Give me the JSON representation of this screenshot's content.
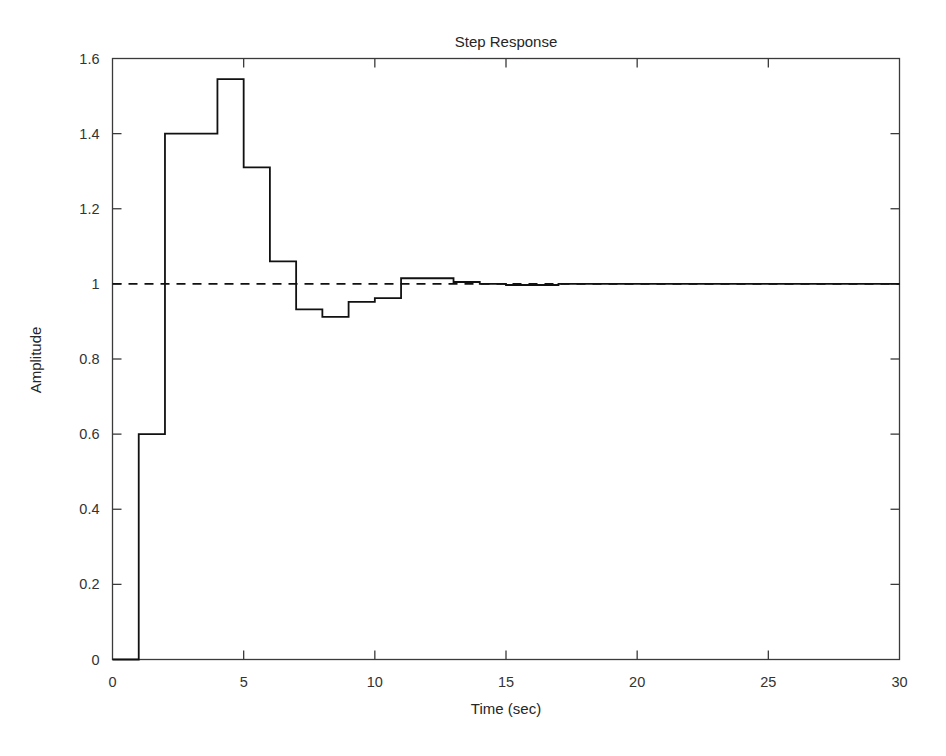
{
  "chart_data": {
    "type": "line",
    "subtype": "step-staircase",
    "title": "Step Response",
    "xlabel": "Time (sec)",
    "ylabel": "Amplitude",
    "xlim": [
      0,
      30
    ],
    "ylim": [
      0,
      1.6
    ],
    "xticks": [
      0,
      5,
      10,
      15,
      20,
      25,
      30
    ],
    "xtick_labels": [
      "0",
      "5",
      "10",
      "15",
      "20",
      "25",
      "30"
    ],
    "yticks": [
      0,
      0.2,
      0.4,
      0.6,
      0.8,
      1,
      1.2,
      1.4,
      1.6
    ],
    "ytick_labels": [
      "0",
      "0.2",
      "0.4",
      "0.6",
      "0.8",
      "1",
      "1.2",
      "1.4",
      "1.6"
    ],
    "grid": false,
    "legend": null,
    "series": [
      {
        "name": "Step Response",
        "style": "staircase",
        "color": "#111111",
        "x": [
          0,
          1,
          2,
          3,
          4,
          5,
          6,
          7,
          8,
          9,
          10,
          11,
          12,
          13,
          14,
          15,
          16,
          17,
          18,
          19,
          20,
          21,
          22,
          23,
          24,
          25,
          26,
          27,
          28,
          29,
          30
        ],
        "values": [
          0,
          0.6,
          1.4,
          1.4,
          1.545,
          1.31,
          1.06,
          0.932,
          0.912,
          0.952,
          0.962,
          1.015,
          1.015,
          1.005,
          1.0,
          0.997,
          0.997,
          1.0,
          1.0,
          1.0,
          1.0,
          1.0,
          1.0,
          1.0,
          1.0,
          1.0,
          1.0,
          1.0,
          1.0,
          1.0,
          1.0
        ]
      },
      {
        "name": "Steady-state reference",
        "style": "dashed-horizontal",
        "color": "#111111",
        "y_value": 1.0,
        "x_range": [
          0,
          30
        ]
      }
    ],
    "annotations": {
      "peak_value": 1.545,
      "peak_time": 4,
      "min_value": 0.912,
      "min_time": 8,
      "final_value": 1.0
    }
  },
  "figure": {
    "background_color": "#ffffff",
    "line_color": "#111111",
    "axis_color": "#3a3a3a"
  }
}
